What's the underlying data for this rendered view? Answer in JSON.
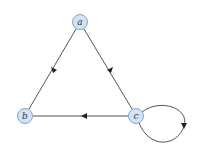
{
  "diagram": {
    "type": "directed-graph",
    "nodes": [
      {
        "id": "a",
        "label": "a"
      },
      {
        "id": "b",
        "label": "b"
      },
      {
        "id": "c",
        "label": "c"
      }
    ],
    "edges": [
      {
        "from": "a",
        "to": "b"
      },
      {
        "from": "a",
        "to": "c"
      },
      {
        "from": "c",
        "to": "b"
      },
      {
        "from": "c",
        "to": "c",
        "kind": "self-loop"
      }
    ],
    "colors": {
      "node_fill": "#d3e3f5",
      "node_stroke": "#7fa6d3",
      "edge": "#555555",
      "arrowhead": "#222222"
    }
  }
}
